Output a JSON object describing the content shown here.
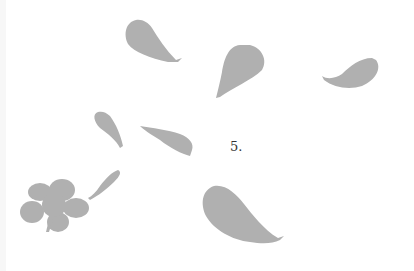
{
  "image": {
    "description": "Gray falling flower petals on white background",
    "background_color": "#ffffff",
    "petal_color": "#b0b0b0",
    "label": "5."
  }
}
